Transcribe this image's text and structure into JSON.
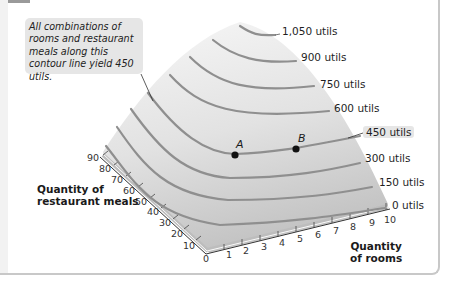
{
  "callout": {
    "text": "All combinations of rooms and restaurant meals along this contour line yield 450 utils."
  },
  "contours": [
    {
      "label": "1,050 utils",
      "value": 1050
    },
    {
      "label": "900 utils",
      "value": 900
    },
    {
      "label": "750 utils",
      "value": 750
    },
    {
      "label": "600 utils",
      "value": 600
    },
    {
      "label": "450 utils",
      "value": 450,
      "highlighted": true
    },
    {
      "label": "300 utils",
      "value": 300
    },
    {
      "label": "150 utils",
      "value": 150
    },
    {
      "label": "0 utils",
      "value": 0
    }
  ],
  "points": [
    {
      "label": "A"
    },
    {
      "label": "B"
    }
  ],
  "axes": {
    "meals": {
      "title_line1": "Quantity of",
      "title_line2": "restaurant meals",
      "ticks": [
        "90",
        "80",
        "70",
        "60",
        "50",
        "40",
        "30",
        "20",
        "10"
      ]
    },
    "origin": "0",
    "rooms": {
      "title_line1": "Quantity",
      "title_line2": "of rooms",
      "ticks": [
        "1",
        "2",
        "3",
        "4",
        "5",
        "6",
        "7",
        "8",
        "9",
        "10"
      ]
    }
  },
  "colors": {
    "surface_top": "#f4f4f4",
    "surface_bottom": "#c9c9c9",
    "contour": "#8f8f8f",
    "callout_bg": "#e6e6e6"
  }
}
